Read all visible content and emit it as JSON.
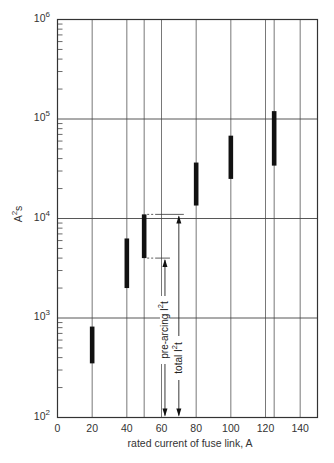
{
  "chart_data": {
    "type": "bar",
    "subtype": "range-bar (floating vertical bars on log scale)",
    "title": "",
    "xlabel": "rated current of fuse link, A",
    "ylabel": "A²s",
    "xlim": [
      0,
      150
    ],
    "ylim": [
      100,
      1000000
    ],
    "yscale": "log",
    "grid": true,
    "x_ticks": [
      0,
      20,
      40,
      60,
      80,
      100,
      120,
      140
    ],
    "x_gridlines": [
      20,
      40,
      50,
      60,
      80,
      100,
      120,
      125,
      140
    ],
    "y_ticks": [
      {
        "value": 100,
        "base": "10",
        "exp": "2"
      },
      {
        "value": 1000,
        "base": "10",
        "exp": "3"
      },
      {
        "value": 10000,
        "base": "10",
        "exp": "4"
      },
      {
        "value": 100000,
        "base": "10",
        "exp": "5"
      },
      {
        "value": 1000000,
        "base": "10",
        "exp": "6"
      }
    ],
    "series": [
      {
        "name": "I²t range (pre-arcing min to total max)",
        "points": [
          {
            "x": 20,
            "low": 350,
            "high": 820
          },
          {
            "x": 40,
            "low": 2000,
            "high": 6300
          },
          {
            "x": 50,
            "low": 4000,
            "high": 11000
          },
          {
            "x": 80,
            "low": 13500,
            "high": 36500
          },
          {
            "x": 100,
            "low": 25000,
            "high": 68000
          },
          {
            "x": 125,
            "low": 34000,
            "high": 120000
          }
        ]
      }
    ],
    "annotations": [
      {
        "label": "pre-arcing I²t",
        "text": "pre-arcing I",
        "sup": "2",
        "sub": "t",
        "refers_to": {
          "x": 50,
          "y": 4000
        },
        "arrow_x": 62
      },
      {
        "label": "total I²t",
        "text": "total I",
        "sup": "2",
        "sub": "t",
        "refers_to": {
          "x": 50,
          "y": 11000
        },
        "arrow_x": 70
      }
    ],
    "legend": "none"
  },
  "axis": {
    "x_title": "rated current of fuse link, A",
    "y_title_base": "A",
    "y_title_sup": "2",
    "y_title_suffix": "s"
  }
}
